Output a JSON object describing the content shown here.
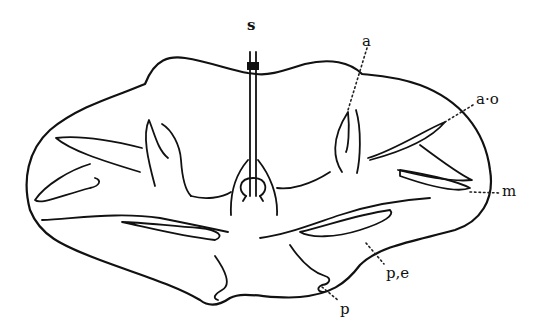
{
  "figure": {
    "type": "anatomical cross-section line drawing",
    "labels": {
      "s": "s",
      "a": "a",
      "ao": "a·o",
      "m": "m",
      "pe": "p,e",
      "p": "p"
    },
    "colors": {
      "ink": "#111111",
      "background": "#ffffff"
    }
  }
}
